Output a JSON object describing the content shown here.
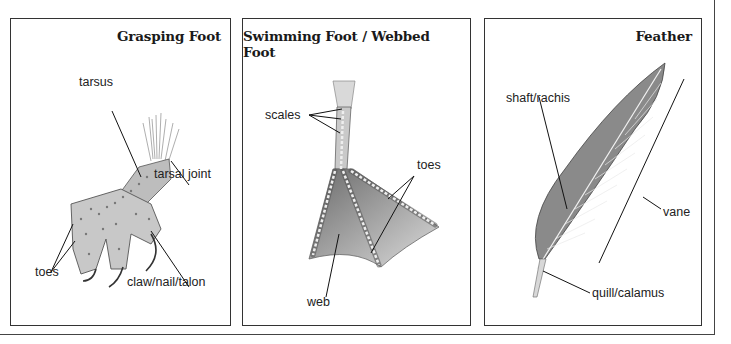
{
  "panels": [
    {
      "title": "Grasping Foot",
      "labels": {
        "tarsus": "tarsus",
        "tarsal_joint": "tarsal joint",
        "toes": "toes",
        "claw": "claw/nail/talon"
      }
    },
    {
      "title": "Swimming Foot / Webbed Foot",
      "labels": {
        "scales": "scales",
        "toes": "toes",
        "web": "web"
      }
    },
    {
      "title": "Feather",
      "labels": {
        "shaft": "shaft/rachis",
        "vane": "vane",
        "quill": "quill/calamus"
      }
    }
  ],
  "colors": {
    "border": "#333333",
    "line": "#111111",
    "illustration_dark": "#555555",
    "illustration_light": "#cfcfcf"
  }
}
